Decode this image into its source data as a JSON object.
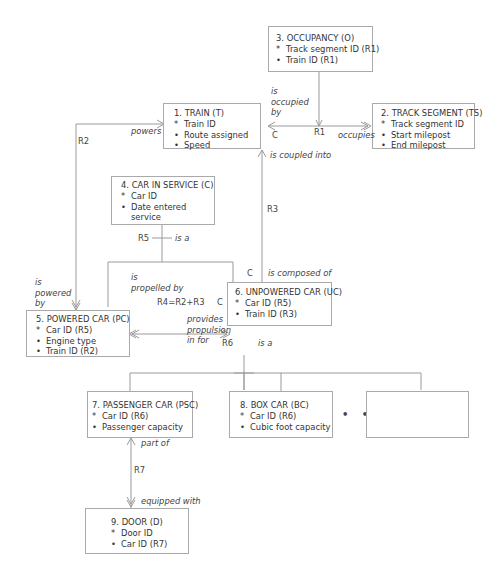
{
  "entities": [
    {
      "id": "train",
      "title": "1. TRAIN (T)",
      "attributes": [
        {
          "marker": "*",
          "text": "Train ID"
        },
        {
          "marker": "•",
          "text": "Route assigned"
        },
        {
          "marker": "•",
          "text": "Speed"
        }
      ]
    },
    {
      "id": "track-segment",
      "title": "2. TRACK SEGMENT (TS)",
      "attributes": [
        {
          "marker": "*",
          "text": "Track segment ID"
        },
        {
          "marker": "•",
          "text": "Start milepost"
        },
        {
          "marker": "•",
          "text": "End milepost"
        }
      ]
    },
    {
      "id": "occupancy",
      "title": "3. OCCUPANCY (O)",
      "attributes": [
        {
          "marker": "*",
          "text": "Track segment ID (R1)"
        },
        {
          "marker": "•",
          "text": "Train ID (R1)"
        }
      ]
    },
    {
      "id": "car-in-service",
      "title": "4. CAR IN SERVICE (C)",
      "attributes": [
        {
          "marker": "*",
          "text": "Car ID"
        },
        {
          "marker": "•",
          "text": "Date entered"
        },
        {
          "marker": "",
          "text": "service"
        }
      ]
    },
    {
      "id": "powered-car",
      "title": "5. POWERED CAR (PC)",
      "attributes": [
        {
          "marker": "*",
          "text": "Car ID (R5)"
        },
        {
          "marker": "•",
          "text": "Engine type"
        },
        {
          "marker": "•",
          "text": "Train ID (R2)"
        }
      ]
    },
    {
      "id": "unpowered-car",
      "title": "6. UNPOWERED CAR (UC)",
      "attributes": [
        {
          "marker": "*",
          "text": "Car ID (R5)"
        },
        {
          "marker": "•",
          "text": "Train ID (R3)"
        }
      ]
    },
    {
      "id": "passenger-car",
      "title": "7. PASSENGER CAR (PSC)",
      "attributes": [
        {
          "marker": "*",
          "text": "Car ID (R6)"
        },
        {
          "marker": "•",
          "text": "Passenger capacity"
        }
      ]
    },
    {
      "id": "box-car",
      "title": "8. BOX CAR (BC)",
      "attributes": [
        {
          "marker": "*",
          "text": "Car ID (R6)"
        },
        {
          "marker": "•",
          "text": "Cubic foot capacity"
        }
      ]
    },
    {
      "id": "door",
      "title": "9. DOOR (D)",
      "attributes": [
        {
          "marker": "*",
          "text": "Door ID"
        },
        {
          "marker": "•",
          "text": "Car ID (R7)"
        }
      ]
    }
  ],
  "relationships": {
    "r1": {
      "name": "R1",
      "phrase_a": "is occupied by",
      "phrase_b": "occupies",
      "cond": "C"
    },
    "r2": {
      "name": "R2",
      "phrase_a": "powers",
      "phrase_b": "is powered by"
    },
    "r3": {
      "name": "R3",
      "phrase_a": "is coupled into",
      "phrase_b": "is composed of",
      "cond_a": "C",
      "cond_b": "C"
    },
    "r4": {
      "name": "R4=R2+R3",
      "phrase_a": "is propelled by",
      "phrase_b": "provides propulsion in for",
      "cond": "C"
    },
    "r5": {
      "name": "R5",
      "phrase": "is a"
    },
    "r6": {
      "name": "R6",
      "phrase": "is a"
    },
    "r7": {
      "name": "R7",
      "phrase_a": "part of",
      "phrase_b": "equipped with"
    }
  },
  "labels": {
    "is_occupied_1": "is",
    "is_occupied_2": "occupied",
    "is_occupied_3": "by",
    "is_powered_1": "is",
    "is_powered_2": "powered",
    "is_powered_3": "by",
    "is_propelled_1": "is",
    "is_propelled_2": "propelled by",
    "provides_1": "provides",
    "provides_2": "propulsion",
    "provides_3": "in for",
    "ellipsis": "• • •"
  }
}
